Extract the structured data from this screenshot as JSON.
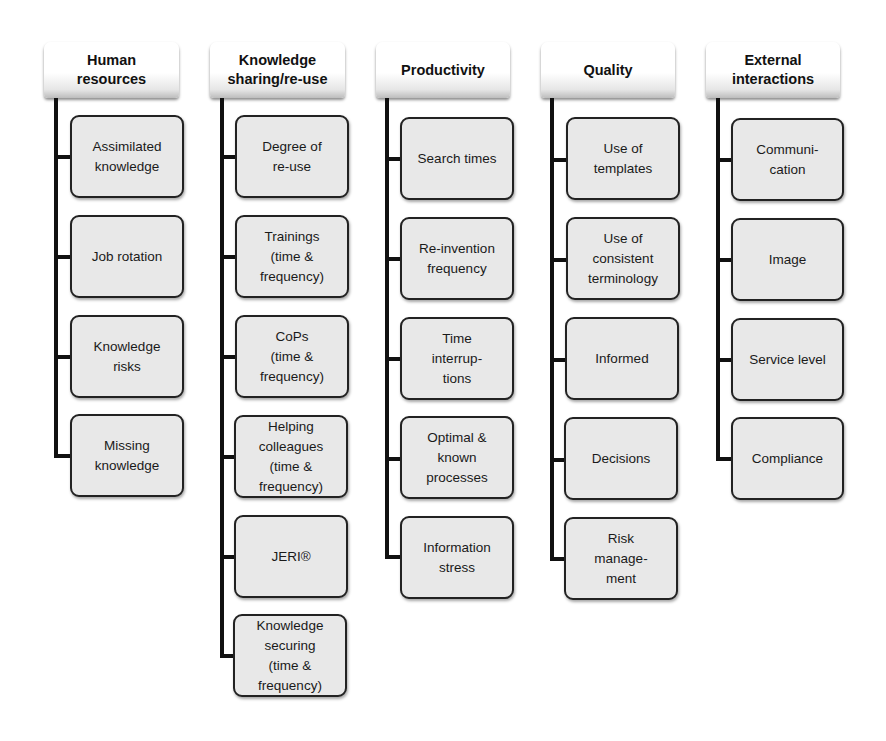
{
  "diagram": {
    "columns": [
      {
        "title": "Human\nresources",
        "items": [
          "Assimilated\nknowledge",
          "Job rotation",
          "Knowledge\nrisks",
          "Missing\nknowledge"
        ]
      },
      {
        "title": "Knowledge\nsharing/re-use",
        "items": [
          "Degree of\nre-use",
          "Trainings\n(time &\nfrequency)",
          "CoPs\n(time &\nfrequency)",
          "Helping\ncolleagues\n(time &\nfrequency)",
          "JERI®",
          "Knowledge\nsecuring\n(time &\nfrequency)"
        ]
      },
      {
        "title": "Productivity",
        "items": [
          "Search times",
          "Re-invention\nfrequency",
          "Time\ninterrup-\ntions",
          "Optimal &\nknown\nprocesses",
          "Information\nstress"
        ]
      },
      {
        "title": "Quality",
        "items": [
          "Use of\ntemplates",
          "Use of\nconsistent\nterminology",
          "Informed",
          "Decisions",
          "Risk\nmanage-\nment"
        ]
      },
      {
        "title": "External\ninteractions",
        "items": [
          "Communi-\ncation",
          "Image",
          "Service level",
          "Compliance"
        ]
      }
    ]
  }
}
